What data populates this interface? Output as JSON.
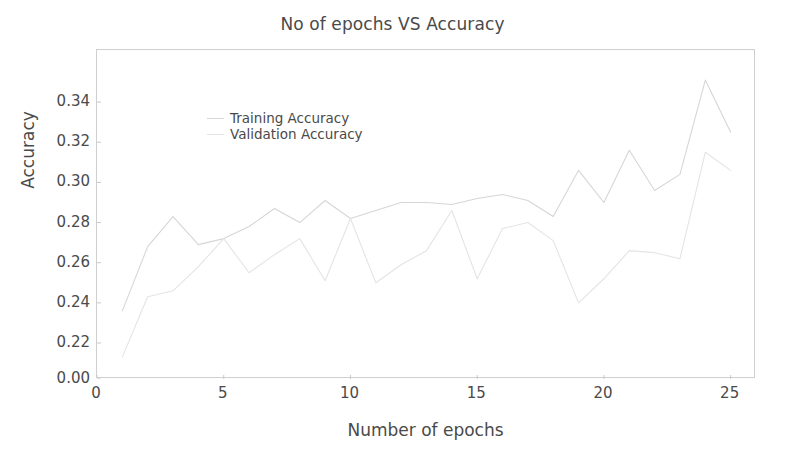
{
  "chart_data": {
    "type": "line",
    "title": "No of epochs VS Accuracy",
    "xlabel": "Number of epochs",
    "ylabel": "Accuracy",
    "grid": false,
    "legend_position": "upper left",
    "x": [
      1,
      2,
      3,
      4,
      5,
      6,
      7,
      8,
      9,
      10,
      11,
      12,
      13,
      14,
      15,
      16,
      17,
      18,
      19,
      20,
      21,
      22,
      23,
      24,
      25
    ],
    "xlim": [
      0,
      26
    ],
    "ylim": [
      0.0,
      0.355
    ],
    "xticks": [
      "0",
      "5",
      "10",
      "15",
      "20",
      "25"
    ],
    "xtick_values": [
      0,
      5,
      10,
      15,
      20,
      25
    ],
    "yticks": [
      "0.00",
      "0.22",
      "0.24",
      "0.26",
      "0.28",
      "0.30",
      "0.32",
      "0.34"
    ],
    "ytick_values": [
      0.0,
      0.22,
      0.24,
      0.26,
      0.28,
      0.3,
      0.32,
      0.34
    ],
    "series": [
      {
        "name": "Training Accuracy",
        "color": "#d6d6d6",
        "values": [
          0.236,
          0.268,
          0.283,
          0.269,
          0.272,
          0.278,
          0.287,
          0.28,
          0.291,
          0.282,
          0.286,
          0.29,
          0.29,
          0.289,
          0.292,
          0.294,
          0.291,
          0.283,
          0.306,
          0.29,
          0.316,
          0.296,
          0.304,
          0.351,
          0.325
        ]
      },
      {
        "name": "Validation Accuracy",
        "color": "#e4e4e4",
        "values": [
          0.135,
          0.243,
          0.246,
          0.258,
          0.272,
          0.255,
          0.264,
          0.272,
          0.251,
          0.282,
          0.25,
          0.259,
          0.266,
          0.286,
          0.252,
          0.277,
          0.28,
          0.271,
          0.24,
          0.252,
          0.266,
          0.265,
          0.262,
          0.315,
          0.306
        ]
      }
    ]
  },
  "legend": {
    "items": [
      {
        "label": "Training Accuracy"
      },
      {
        "label": "Validation Accuracy"
      }
    ]
  }
}
